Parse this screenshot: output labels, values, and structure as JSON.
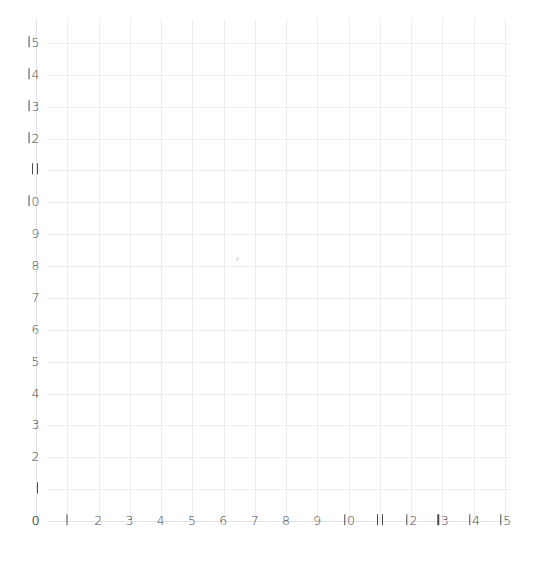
{
  "chart_data": {
    "type": "scatter",
    "title": "",
    "subtitle": "",
    "xlabel": "",
    "ylabel": "",
    "xlim": [
      0,
      15
    ],
    "ylim": [
      0,
      15
    ],
    "grid": true,
    "legend": null,
    "legend_position": "none",
    "x_ticks": [
      "0",
      "1",
      "2",
      "3",
      "4",
      "5",
      "6",
      "7",
      "8",
      "9",
      "10",
      "11",
      "12",
      "13",
      "14",
      "15"
    ],
    "y_ticks": [
      "0",
      "1",
      "2",
      "3",
      "4",
      "5",
      "6",
      "7",
      "8",
      "9",
      "10",
      "11",
      "12",
      "13",
      "14",
      "15"
    ],
    "x": [],
    "y": [],
    "series": [],
    "annotations": []
  },
  "axes": {
    "x_axis_name": "x-axis",
    "y_axis_name": "y-axis",
    "x_min": 0,
    "x_max": 15,
    "y_min": 0,
    "y_max": 15,
    "step": 1
  },
  "style": {
    "background": "#ffffff",
    "gridline_color": "#ededf0",
    "axis_color": "#e4e4e8",
    "label_color": "#4a4a4a",
    "artifact_color": "#dcdce2"
  },
  "artifact": {
    "name": "stray-mark",
    "x_value": 6.4,
    "y_value": 8.3
  }
}
